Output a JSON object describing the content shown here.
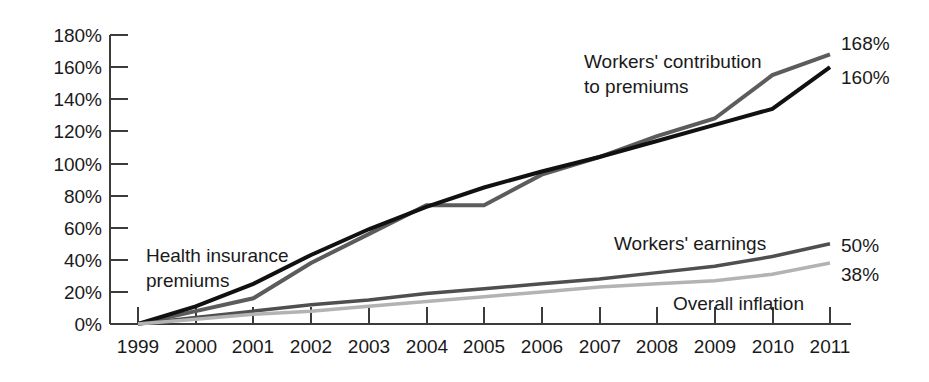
{
  "chart_data": {
    "type": "line",
    "title": "",
    "subtitle": "",
    "xlabel": "",
    "ylabel": "",
    "grid": false,
    "legend_position": "inline-annotations",
    "categories": [
      "1999",
      "2000",
      "2001",
      "2002",
      "2003",
      "2004",
      "2005",
      "2006",
      "2007",
      "2008",
      "2009",
      "2010",
      "2011"
    ],
    "x": [
      1999,
      2000,
      2001,
      2002,
      2003,
      2004,
      2005,
      2006,
      2007,
      2008,
      2009,
      2010,
      2011
    ],
    "xlim": [
      1999,
      2011
    ],
    "ylim": [
      0,
      180
    ],
    "ytick_labels": [
      "0%",
      "20%",
      "40%",
      "60%",
      "80%",
      "100%",
      "120%",
      "140%",
      "160%",
      "180%"
    ],
    "ytick_values": [
      0,
      20,
      40,
      60,
      80,
      100,
      120,
      140,
      160,
      180
    ],
    "series": [
      {
        "name": "Workers' contribution to premiums",
        "color": "#5c5c5c",
        "stroke_width": 4,
        "end_value_label": "168%",
        "values": [
          0,
          8,
          16,
          38,
          56,
          74,
          74,
          93,
          104,
          117,
          128,
          155,
          168
        ]
      },
      {
        "name": "Health insurance premiums",
        "color": "#111111",
        "stroke_width": 4,
        "end_value_label": "160%",
        "values": [
          0,
          11,
          25,
          43,
          59,
          73,
          85,
          95,
          104,
          114,
          124,
          134,
          160
        ]
      },
      {
        "name": "Workers' earnings",
        "color": "#4f4f4f",
        "stroke_width": 3.5,
        "end_value_label": "50%",
        "values": [
          0,
          4,
          8,
          12,
          15,
          19,
          22,
          25,
          28,
          32,
          36,
          42,
          50
        ]
      },
      {
        "name": "Overall inflation",
        "color": "#b3b3b3",
        "stroke_width": 3.5,
        "end_value_label": "38%",
        "values": [
          0,
          3,
          6,
          8,
          11,
          14,
          17,
          20,
          23,
          25,
          27,
          31,
          38
        ]
      }
    ],
    "annotations": [
      {
        "text_line1": "Workers' contribution",
        "text_line2": "to premiums",
        "x": 584,
        "y": 68
      },
      {
        "text_line1": "Health insurance",
        "text_line2": "premiums",
        "x": 146,
        "y": 262
      },
      {
        "text_line1": "Workers' earnings",
        "text_line2": "",
        "x": 614,
        "y": 250
      },
      {
        "text_line1": "Overall inflation",
        "text_line2": "",
        "x": 673,
        "y": 310
      }
    ],
    "end_labels": [
      {
        "label": "168%",
        "x": 841,
        "y": 50
      },
      {
        "label": "160%",
        "x": 841,
        "y": 84
      },
      {
        "label": "50%",
        "x": 841,
        "y": 252
      },
      {
        "label": "38%",
        "x": 841,
        "y": 281
      }
    ],
    "axis": {
      "color": "#3b3b3b",
      "origin_x": 138,
      "origin_y": 324,
      "top_y": 35,
      "right_x": 830
    }
  }
}
